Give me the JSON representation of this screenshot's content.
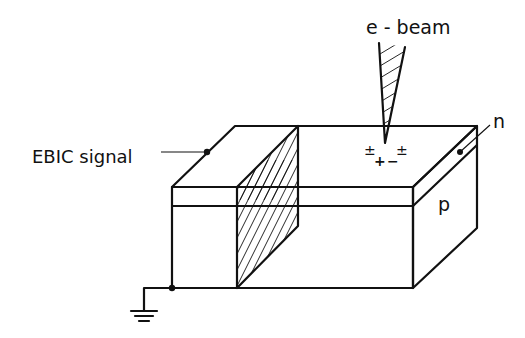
{
  "figure": {
    "colors": {
      "ink": "#111111",
      "background": "#ffffff"
    }
  },
  "labels": {
    "beam": "e - beam",
    "signal": "EBIC signal",
    "n_layer": "n",
    "p_layer": "p"
  },
  "charges": {
    "left_pair": "±",
    "right_pair": "±",
    "plus": "+",
    "minus": "−"
  },
  "components": [
    {
      "id": "sample-block",
      "label": "p-n junction sample (n layer on p substrate)"
    },
    {
      "id": "electron-beam",
      "label": "e - beam"
    },
    {
      "id": "junction-plane",
      "label": "hatched cross-sectional plane"
    },
    {
      "id": "signal-contact",
      "label": "EBIC signal"
    },
    {
      "id": "ground-contact",
      "label": "ground"
    }
  ]
}
